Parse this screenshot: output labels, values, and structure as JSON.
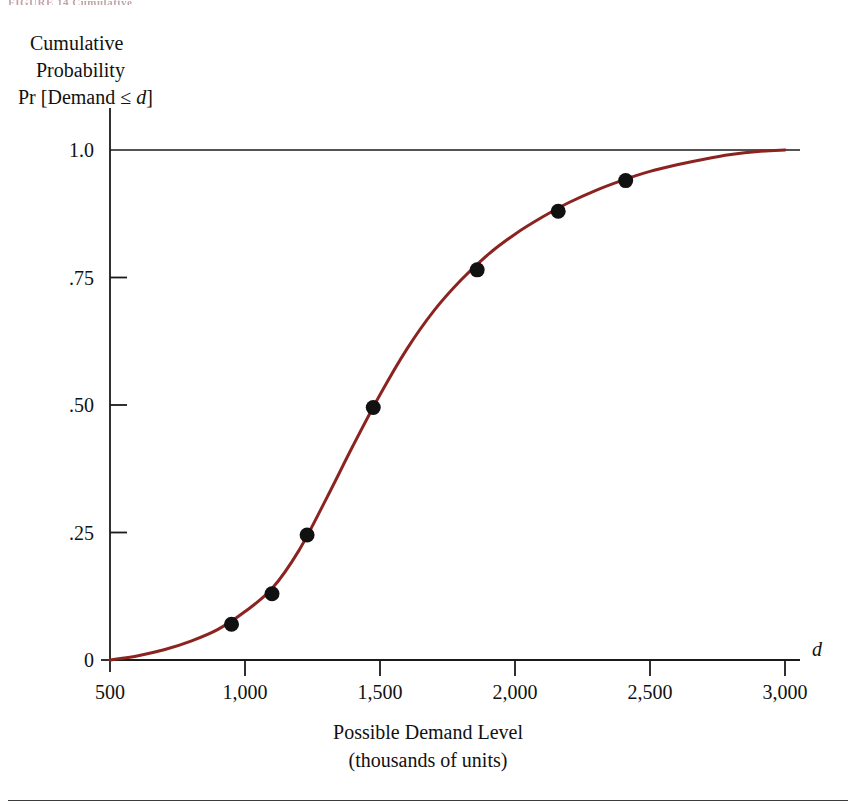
{
  "page": {
    "top_fragment": "FIGURE 14  Cumulative",
    "background_color": "#ffffff"
  },
  "axis_titles": {
    "y_line1": "Cumulative",
    "y_line2": "Probability",
    "y_line3_prefix": "Pr [Demand ≤ ",
    "y_line3_var": "d",
    "y_line3_suffix": "]",
    "x_line1": "Possible Demand Level",
    "x_line2": "(thousands of units)",
    "x_axis_variable": "d"
  },
  "chart_data": {
    "type": "line",
    "title": "",
    "xlabel": "Possible Demand Level (thousands of units)",
    "ylabel": "Cumulative Probability Pr [Demand ≤ d]",
    "xlim": [
      500,
      3000
    ],
    "ylim": [
      0,
      1.0
    ],
    "grid": false,
    "legend": "none",
    "curve_color": "#8B2420",
    "point_color": "#111111",
    "xticks": [
      500,
      1000,
      1500,
      2000,
      2500,
      3000
    ],
    "xticklabels": [
      "500",
      "1,000",
      "1,500",
      "2,000",
      "2,500",
      "3,000"
    ],
    "yticks": [
      0,
      0.25,
      0.5,
      0.75,
      1.0
    ],
    "yticklabels": [
      "0",
      ".25",
      ".50",
      ".75",
      "1.0"
    ],
    "series": [
      {
        "name": "Cumulative distribution curve",
        "kind": "line",
        "x": [
          500,
          600,
          700,
          800,
          900,
          1000,
          1100,
          1200,
          1300,
          1400,
          1500,
          1600,
          1700,
          1800,
          1900,
          2000,
          2100,
          2200,
          2300,
          2400,
          2500,
          2600,
          2700,
          2800,
          2900,
          3000
        ],
        "y": [
          0.0,
          0.008,
          0.02,
          0.037,
          0.06,
          0.095,
          0.14,
          0.215,
          0.315,
          0.42,
          0.52,
          0.61,
          0.685,
          0.745,
          0.795,
          0.835,
          0.868,
          0.897,
          0.921,
          0.941,
          0.958,
          0.971,
          0.982,
          0.991,
          0.997,
          1.0
        ]
      },
      {
        "name": "Plotted data points",
        "kind": "scatter",
        "x": [
          950,
          1100,
          1230,
          1475,
          1860,
          2160,
          2410
        ],
        "y": [
          0.07,
          0.13,
          0.245,
          0.495,
          0.765,
          0.88,
          0.94
        ]
      }
    ]
  }
}
